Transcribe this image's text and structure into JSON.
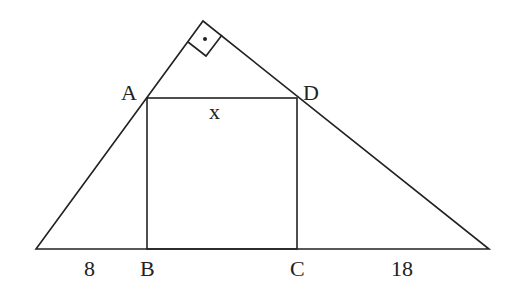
{
  "diagram": {
    "labels": {
      "A": "A",
      "D": "D",
      "B": "B",
      "C": "C",
      "x": "x",
      "left_segment": "8",
      "right_segment": "18"
    },
    "right_angle_mark": "dot",
    "stroke_color": "#222222"
  }
}
